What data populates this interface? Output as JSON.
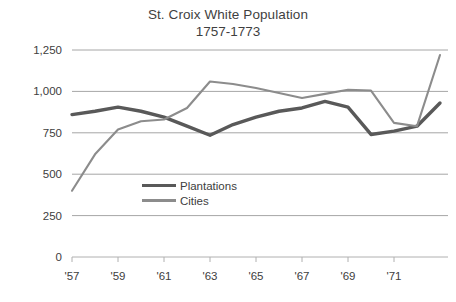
{
  "chart_data": {
    "type": "line",
    "title": "St. Croix White Population",
    "subtitle": "1757-1773",
    "xlabel": "",
    "ylabel": "",
    "ylim": [
      0,
      1250
    ],
    "yticks": [
      "0",
      "250",
      "500",
      "750",
      "1,000",
      "1,250"
    ],
    "ytick_values": [
      0,
      250,
      500,
      750,
      1000,
      1250
    ],
    "grid": "horizontal",
    "legend_position": "inside-center-lower",
    "x": [
      1757,
      1758,
      1759,
      1760,
      1761,
      1762,
      1763,
      1764,
      1765,
      1766,
      1767,
      1768,
      1769,
      1770,
      1771,
      1772,
      1773
    ],
    "xtick_labels": [
      "'57",
      "'59",
      "'61",
      "'63",
      "'65",
      "'67",
      "'69",
      "'71"
    ],
    "xtick_values": [
      1757,
      1759,
      1761,
      1763,
      1765,
      1767,
      1769,
      1771
    ],
    "series": [
      {
        "name": "Plantations",
        "color": "#595959",
        "width": 3.4,
        "values": [
          860,
          880,
          905,
          880,
          845,
          790,
          735,
          800,
          845,
          880,
          900,
          940,
          905,
          740,
          760,
          790,
          930
        ]
      },
      {
        "name": "Cities",
        "color": "#8c8c8c",
        "width": 2.1,
        "values": [
          400,
          620,
          770,
          820,
          830,
          900,
          1060,
          1045,
          1020,
          990,
          960,
          985,
          1010,
          1005,
          810,
          790,
          1220
        ]
      }
    ]
  },
  "legend": {
    "items": [
      {
        "label": "Plantations"
      },
      {
        "label": "Cities"
      }
    ]
  },
  "colors": {
    "plantations": "#595959",
    "cities": "#8c8c8c",
    "grid": "#a6a6a6",
    "text": "#404040"
  }
}
